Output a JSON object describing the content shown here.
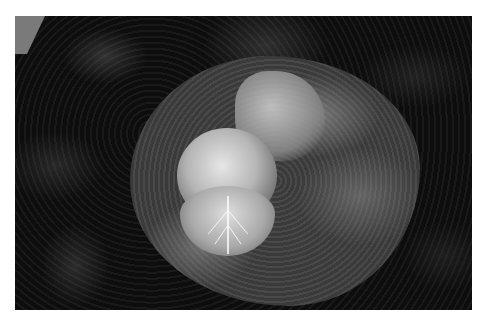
{
  "image": {
    "subject": "savoy cabbage",
    "style": "black-and-white photograph",
    "background_color": "#ffffff",
    "photo_bounds": {
      "left": 15,
      "top": 16,
      "width": 457,
      "height": 294
    }
  }
}
